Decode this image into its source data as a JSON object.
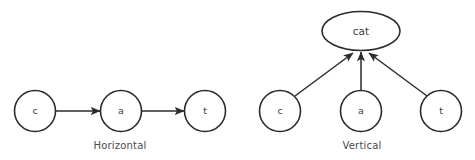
{
  "figure": {
    "background_color": "#ffffff",
    "stroke_color": "#2b2b2b",
    "text_color": "#3d3d3d",
    "panels": [
      {
        "id": "horizontal",
        "caption": "Horizontal",
        "caption_x": 120,
        "caption_y": 146,
        "nodes": [
          {
            "id": "h-c",
            "label": "c",
            "shape": "circle",
            "cx": 35,
            "cy": 111,
            "r": 20.5
          },
          {
            "id": "h-a",
            "label": "a",
            "shape": "circle",
            "cx": 121,
            "cy": 111,
            "r": 20.5
          },
          {
            "id": "h-t",
            "label": "t",
            "shape": "circle",
            "cx": 205,
            "cy": 111,
            "r": 20.5
          }
        ],
        "edges": [
          {
            "id": "h-c-to-a",
            "from": "h-c",
            "to": "h-a",
            "x1": 56,
            "y1": 111,
            "x2": 100,
            "y2": 111,
            "arrow": true
          },
          {
            "id": "h-a-to-t",
            "from": "h-a",
            "to": "h-t",
            "x1": 142,
            "y1": 111,
            "x2": 184,
            "y2": 111,
            "arrow": true
          }
        ]
      },
      {
        "id": "vertical",
        "caption": "Vertical",
        "caption_x": 362,
        "caption_y": 146,
        "nodes": [
          {
            "id": "v-cat",
            "label": "cat",
            "shape": "ellipse",
            "cx": 361,
            "cy": 31,
            "rx": 39,
            "ry": 19.5
          },
          {
            "id": "v-c",
            "label": "c",
            "shape": "circle",
            "cx": 280,
            "cy": 111,
            "r": 20.5
          },
          {
            "id": "v-a",
            "label": "a",
            "shape": "circle",
            "cx": 361,
            "cy": 111,
            "r": 20.5
          },
          {
            "id": "v-t",
            "label": "t",
            "shape": "circle",
            "cx": 441,
            "cy": 111,
            "r": 20.5
          }
        ],
        "edges": [
          {
            "id": "v-c-to-cat",
            "from": "v-c",
            "to": "v-cat",
            "x1": 295,
            "y1": 96,
            "x2": 353,
            "y2": 53,
            "arrow": true
          },
          {
            "id": "v-a-to-cat",
            "from": "v-a",
            "to": "v-cat",
            "x1": 361,
            "y1": 90,
            "x2": 361,
            "y2": 52,
            "arrow": true
          },
          {
            "id": "v-t-to-cat",
            "from": "v-t",
            "to": "v-cat",
            "x1": 427,
            "y1": 96,
            "x2": 369,
            "y2": 53,
            "arrow": true
          }
        ]
      }
    ]
  }
}
